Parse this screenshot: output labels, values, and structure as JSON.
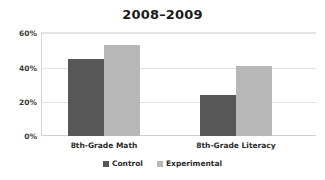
{
  "chart_data": {
    "type": "bar",
    "title": "2008–2009",
    "xlabel": "",
    "ylabel": "",
    "categories": [
      "8th-Grade Math",
      "8th-Grade Literacy"
    ],
    "series": [
      {
        "name": "Control",
        "values": [
          45,
          24
        ],
        "color": "#575757"
      },
      {
        "name": "Experimental",
        "values": [
          53,
          41
        ],
        "color": "#b8b8b8"
      }
    ],
    "ylim": [
      0,
      60
    ],
    "yticks": [
      0,
      20,
      40,
      60
    ],
    "ytick_labels": [
      "0%",
      "20%",
      "40%",
      "60%"
    ],
    "grid": true,
    "legend_position": "bottom"
  },
  "axis": {
    "y_ticks": [
      {
        "label": "60%",
        "value": 60
      },
      {
        "label": "40%",
        "value": 40
      },
      {
        "label": "20%",
        "value": 20
      },
      {
        "label": "0%",
        "value": 0
      }
    ]
  },
  "legend": {
    "items": [
      {
        "label": "Control",
        "swatch": "legend-swatch-control"
      },
      {
        "label": "Experimental",
        "swatch": "legend-swatch-experimental"
      }
    ]
  }
}
